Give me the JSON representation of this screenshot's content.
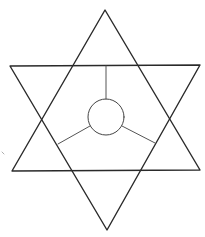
{
  "diagram": {
    "title": "",
    "colors": {
      "background": "#ffffff",
      "outline": "#2a2a2a",
      "spoke": "#555555"
    },
    "shapes": [
      {
        "id": "triangle-up",
        "kind": "triangle",
        "orientation": "apex-up"
      },
      {
        "id": "triangle-down",
        "kind": "triangle",
        "orientation": "apex-down"
      },
      {
        "id": "center-circle",
        "kind": "circle"
      },
      {
        "id": "spoke-top",
        "kind": "line",
        "connects": [
          "center-circle",
          "triangle-down top edge"
        ]
      },
      {
        "id": "spoke-lower-left",
        "kind": "line",
        "connects": [
          "center-circle",
          "triangle-up left side"
        ]
      },
      {
        "id": "spoke-lower-right",
        "kind": "line",
        "connects": [
          "center-circle",
          "triangle-up right side"
        ]
      }
    ],
    "labels": []
  }
}
